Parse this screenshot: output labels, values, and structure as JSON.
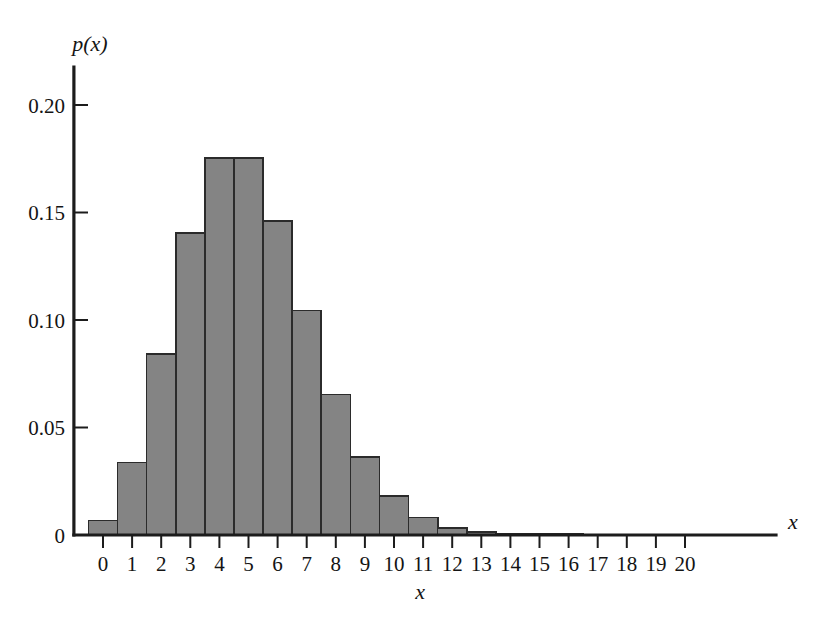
{
  "chart_data": {
    "type": "bar",
    "title": "",
    "subtitle": "",
    "xlabel": "x",
    "ylabel": "p(x)",
    "axis_end_label": "x",
    "categories": [
      0,
      1,
      2,
      3,
      4,
      5,
      6,
      7,
      8,
      9,
      10,
      11,
      12,
      13,
      14,
      15,
      16,
      17,
      18,
      19,
      20
    ],
    "values": [
      0.0067,
      0.0337,
      0.0842,
      0.1404,
      0.1755,
      0.1755,
      0.1462,
      0.1044,
      0.0653,
      0.0363,
      0.0181,
      0.0082,
      0.0034,
      0.0013,
      0.0005,
      0.0002,
      0.0001,
      0.0,
      0.0,
      0.0,
      0.0
    ],
    "xtick_labels": [
      "0",
      "1",
      "2",
      "3",
      "4",
      "5",
      "6",
      "7",
      "8",
      "9",
      "10",
      "11",
      "12",
      "13",
      "14",
      "15",
      "16",
      "17",
      "18",
      "19",
      "20"
    ],
    "ytick_values": [
      0,
      0.05,
      0.1,
      0.15,
      0.2
    ],
    "ytick_labels": [
      "0",
      "0.05",
      "0.10",
      "0.15",
      "0.20"
    ],
    "xlim": [
      -0.5,
      21.2
    ],
    "ylim": [
      0,
      0.2245
    ],
    "grid": false,
    "legend": null,
    "bar_fill_color": "#848484",
    "bar_edge_color": "#2b2b2b",
    "axis_color": "#1c1c1c",
    "background_color": "#ffffff",
    "bar_align": "center",
    "bar_width": 1.0
  }
}
